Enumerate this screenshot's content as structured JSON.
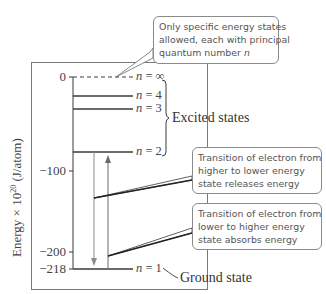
{
  "diagram": {
    "y_axis": {
      "label": "Energy × 10^20 (J/atom)",
      "label_prefix": "Energy × 10",
      "label_exponent": "20",
      "label_suffix": " (J/atom)",
      "ticks": [
        {
          "value": "0",
          "y": 77
        },
        {
          "value": "−100",
          "y": 171
        },
        {
          "value": "−200",
          "y": 252
        },
        {
          "value": "−218",
          "y": 269
        }
      ]
    },
    "levels": [
      {
        "n": "∞",
        "label_var": "n",
        "label_eq": " = ",
        "label_num": "∞",
        "y": 77,
        "energy": 0,
        "style": "dashed"
      },
      {
        "n": "4",
        "label_var": "n",
        "label_eq": " = ",
        "label_num": "4",
        "y": 96,
        "energy": -13.6,
        "style": "solid"
      },
      {
        "n": "3",
        "label_var": "n",
        "label_eq": " = ",
        "label_num": "3",
        "y": 109,
        "energy": -24.2,
        "style": "solid"
      },
      {
        "n": "2",
        "label_var": "n",
        "label_eq": " = ",
        "label_num": "2",
        "y": 152,
        "energy": -54.5,
        "style": "solid"
      },
      {
        "n": "1",
        "label_var": "n",
        "label_eq": " = ",
        "label_num": "1",
        "y": 269,
        "energy": -218,
        "style": "solid"
      }
    ],
    "bracket_label": "Excited states",
    "ground_label": "Ground state",
    "callouts": [
      {
        "lines": [
          "Only specific energy states",
          "allowed, each with principal",
          "quantum number "
        ],
        "italic_tail": "n"
      },
      {
        "lines": [
          "Transition of electron from",
          "higher to lower energy",
          "state releases energy"
        ]
      },
      {
        "lines": [
          "Transition of electron from",
          "lower to higher energy",
          "state absorbs energy"
        ]
      }
    ],
    "arrows": [
      {
        "name": "emission-arrow",
        "direction": "down",
        "from": "n=2",
        "to": "n=1"
      },
      {
        "name": "absorption-arrow",
        "direction": "up",
        "from": "n=1",
        "to": "n=2"
      }
    ],
    "colors": {
      "line": "#3a3a3a",
      "arrow": "#8c8c8c",
      "frame": "#7a7a7a",
      "callout_border": "#8a8a8a"
    }
  }
}
